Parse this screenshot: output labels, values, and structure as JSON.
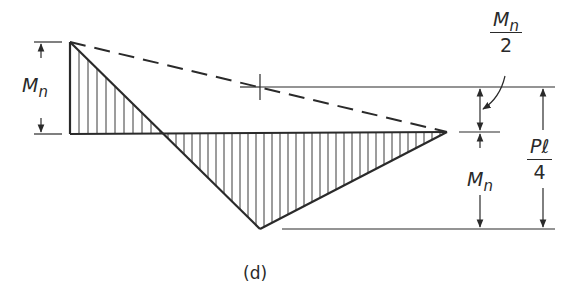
{
  "figure": {
    "caption": "(d)",
    "type": "moment diagram",
    "colors": {
      "line": "#2a2a2a",
      "hatch": "#3a3a3a",
      "background": "#ffffff"
    }
  },
  "labels": {
    "left_moment": {
      "main": "M",
      "sub": "n"
    },
    "right_lower_moment": {
      "main": "M",
      "sub": "n"
    },
    "half_moment": {
      "num_main": "M",
      "num_sub": "n",
      "den": "2"
    },
    "pl_over_4": {
      "num": "Pℓ",
      "den": "4"
    }
  },
  "geometry": {
    "left_peak": [
      70,
      42
    ],
    "baseline_left": [
      70,
      134
    ],
    "zero_crossing": [
      163,
      134
    ],
    "bottom_vertex": [
      260,
      229
    ],
    "right_apex": [
      447,
      132
    ],
    "dashed_line": [
      [
        70,
        42
      ],
      [
        447,
        132
      ]
    ],
    "midpoint_tick": [
      260,
      87
    ]
  }
}
